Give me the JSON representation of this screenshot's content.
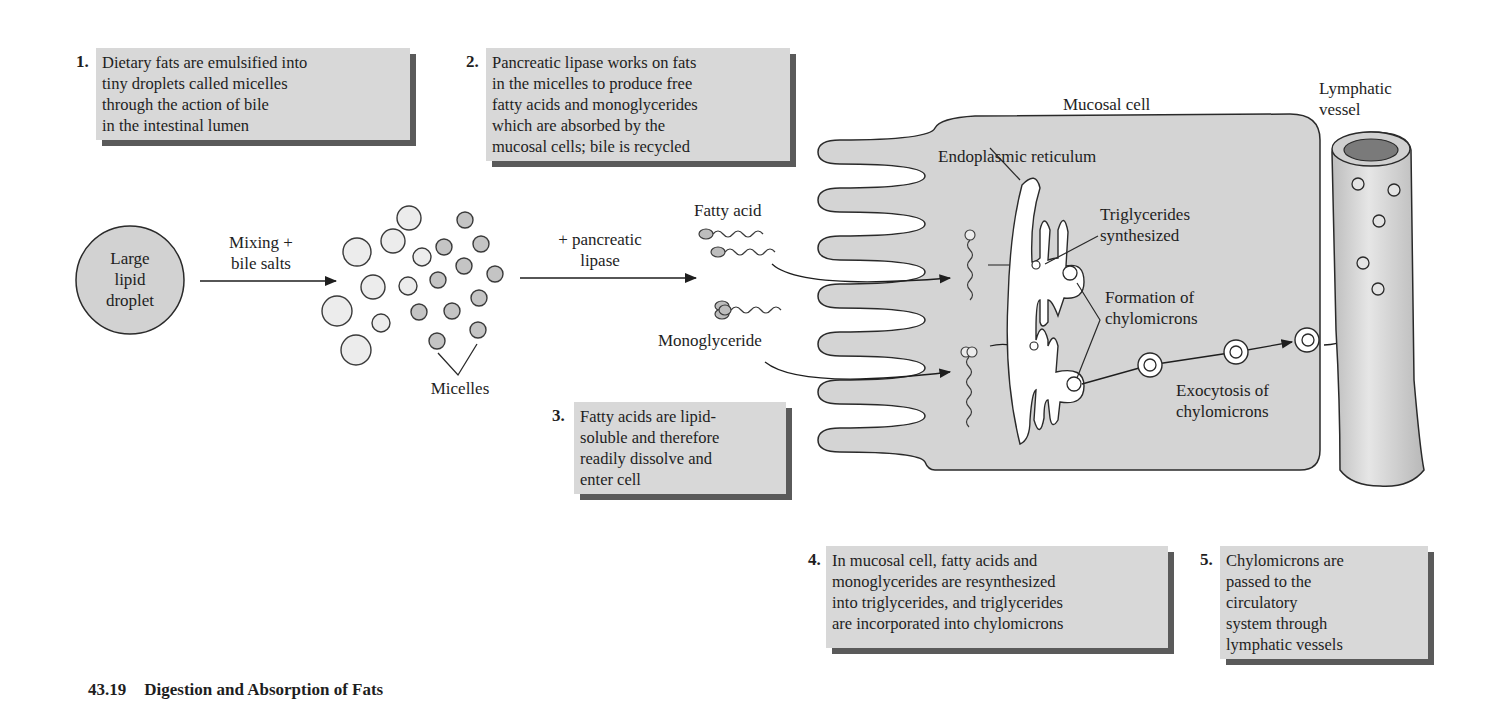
{
  "figure": {
    "number": "43.19",
    "title": "Digestion and Absorption of Fats"
  },
  "steps": [
    {
      "num": "1.",
      "text": "Dietary fats are emulsified into\ntiny droplets called micelles\nthrough the action of bile\nin the intestinal lumen"
    },
    {
      "num": "2.",
      "text": "Pancreatic lipase works on fats\nin the micelles to produce free\nfatty acids and monoglycerides\nwhich are absorbed by the\nmucosal cells; bile is recycled"
    },
    {
      "num": "3.",
      "text": "Fatty acids are lipid-\nsoluble and therefore\nreadily dissolve and\nenter cell"
    },
    {
      "num": "4.",
      "text": "In mucosal cell, fatty acids and\nmonoglycerides are resynthesized\ninto triglycerides, and triglycerides\nare incorporated into chylomicrons"
    },
    {
      "num": "5.",
      "text": "Chylomicrons are\npassed to the\ncirculatory\nsystem through\nlymphatic vessels"
    }
  ],
  "labels": {
    "large_lipid_droplet": "Large\nlipid\ndroplet",
    "mixing_bile_salts": "Mixing +\nbile salts",
    "micelles": "Micelles",
    "pancreatic_lipase": "+ pancreatic\nlipase",
    "fatty_acid": "Fatty acid",
    "monoglyceride": "Monoglyceride",
    "mucosal_cell": "Mucosal cell",
    "endoplasmic_reticulum": "Endoplasmic reticulum",
    "triglycerides_synthesized": "Triglycerides\nsynthesized",
    "formation_of_chylomicrons": "Formation of\nchylomicrons",
    "exocytosis_of_chylomicrons": "Exocytosis of\nchylomicrons",
    "lymphatic_vessel": "Lymphatic\nvessel"
  },
  "colors": {
    "callout_fill": "#d8d8d8",
    "callout_shadow": "#5a5a5a",
    "cell_fill": "#d4d4d4",
    "micelle_fill": "#c4c4c4",
    "lumen_fill": "#7a7a7a",
    "stroke": "#2a2a2a"
  }
}
